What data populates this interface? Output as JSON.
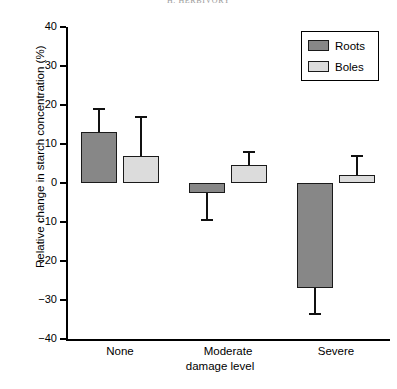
{
  "running_head": "H. HERBIVORY",
  "axes": {
    "y_title": "Relative change in starch concentration (%)",
    "x_title": "damage level",
    "y_ticks": [
      "40",
      "30",
      "20",
      "10",
      "0",
      "−10",
      "−20",
      "−30",
      "−40"
    ],
    "x_categories": [
      "None",
      "Moderate",
      "Severe"
    ]
  },
  "legend": {
    "items": [
      {
        "label": "Roots",
        "color": "#878787"
      },
      {
        "label": "Boles",
        "color": "#dcdcdc"
      }
    ]
  },
  "chart_data": {
    "type": "bar",
    "title": "",
    "xlabel": "damage level",
    "ylabel": "Relative change in starch concentration (%)",
    "ylim": [
      -40,
      40
    ],
    "yticks": [
      40,
      30,
      20,
      10,
      0,
      -10,
      -20,
      -30,
      -40
    ],
    "grid": false,
    "legend_position": "top-right",
    "categories": [
      "None",
      "Moderate",
      "Severe"
    ],
    "series": [
      {
        "name": "Roots",
        "color": "#878787",
        "values": [
          13,
          -2.5,
          -27
        ],
        "errors": [
          6,
          7,
          6.5
        ]
      },
      {
        "name": "Boles",
        "color": "#dcdcdc",
        "values": [
          7,
          4.5,
          2
        ],
        "errors": [
          10,
          3.5,
          5
        ]
      }
    ]
  }
}
